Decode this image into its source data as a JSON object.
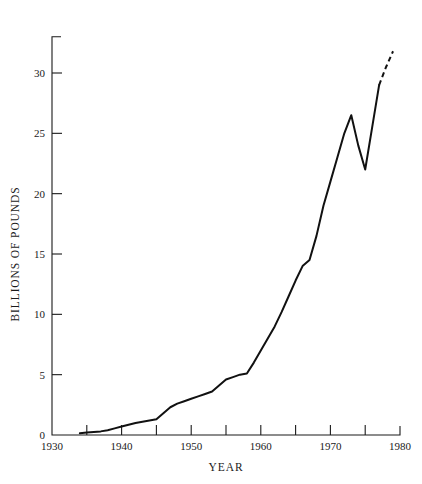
{
  "chart_data": {
    "type": "line",
    "title": "",
    "xlabel": "YEAR",
    "ylabel": "BILLIONS OF POUNDS",
    "xlim": [
      1930,
      1980
    ],
    "ylim": [
      0,
      33
    ],
    "grid": false,
    "legend": null,
    "x_major_ticks": [
      1930,
      1940,
      1950,
      1960,
      1970,
      1980
    ],
    "x_major_tick_labels": [
      "1930",
      "1940",
      "1950",
      "1960",
      "1970",
      "1980"
    ],
    "x_minor_ticks": [
      1935,
      1945,
      1955,
      1965,
      1975
    ],
    "y_ticks": [
      0,
      5,
      10,
      15,
      20,
      25,
      30
    ],
    "y_tick_labels": [
      "0",
      "5",
      "10",
      "15",
      "20",
      "25",
      "30"
    ],
    "series": [
      {
        "name": "observed",
        "style": "solid",
        "x": [
          1934,
          1935,
          1936,
          1937,
          1938,
          1939,
          1940,
          1941,
          1942,
          1943,
          1944,
          1945,
          1946,
          1947,
          1948,
          1949,
          1950,
          1951,
          1952,
          1953,
          1954,
          1955,
          1956,
          1957,
          1958,
          1959,
          1960,
          1961,
          1962,
          1963,
          1964,
          1965,
          1966,
          1967,
          1968,
          1969,
          1970,
          1971,
          1972,
          1973,
          1974,
          1975,
          1976,
          1977
        ],
        "values": [
          0.15,
          0.2,
          0.25,
          0.3,
          0.4,
          0.55,
          0.7,
          0.85,
          1.0,
          1.1,
          1.2,
          1.3,
          1.8,
          2.3,
          2.6,
          2.8,
          3.0,
          3.2,
          3.4,
          3.6,
          4.1,
          4.6,
          4.8,
          5.0,
          5.1,
          6.0,
          7.0,
          8.0,
          9.0,
          10.2,
          11.5,
          12.8,
          14.0,
          14.5,
          16.5,
          19.0,
          21.0,
          23.0,
          25.0,
          26.5,
          24.0,
          22.0,
          25.5,
          29.0
        ]
      },
      {
        "name": "projected",
        "style": "dashed",
        "x": [
          1977,
          1978,
          1979
        ],
        "values": [
          29.0,
          30.5,
          31.8
        ]
      }
    ]
  },
  "axes": {
    "y_title": "BILLIONS OF POUNDS",
    "x_title": "YEAR"
  }
}
